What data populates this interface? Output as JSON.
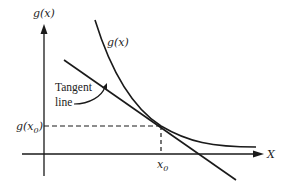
{
  "diagram": {
    "title": "",
    "y_axis_label": "g(x)",
    "x_axis_label": "X",
    "curve_label": "g(x)",
    "tangent_label_line1": "Tangent",
    "tangent_label_line2": "line",
    "point_y_label_base": "g(x",
    "point_y_label_sub": "0",
    "point_y_label_close": ")",
    "point_x_label_base": "x",
    "point_x_label_sub": "0",
    "colors": {
      "ink": "#1a1a1a",
      "background": "#ffffff"
    }
  }
}
